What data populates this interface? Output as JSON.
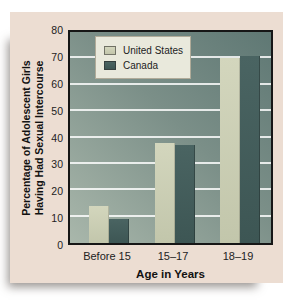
{
  "chart_data": {
    "type": "bar",
    "categories": [
      "Before 15",
      "15–17",
      "18–19"
    ],
    "series": [
      {
        "name": "United States",
        "color_top": "#d3d6bd",
        "color": "#c2c6ab",
        "values": [
          14,
          38,
          70
        ]
      },
      {
        "name": "Canada",
        "color_top": "#4a6462",
        "color": "#3d5654",
        "values": [
          9,
          37,
          71
        ]
      }
    ],
    "xlabel": "Age in Years",
    "ylabel_line1": "Percentage of Adolescent Girls",
    "ylabel_line2": "Having Had Sexual Intercourse",
    "ylim": [
      0,
      80
    ],
    "ytick_step": 10,
    "yticks": [
      0,
      10,
      20,
      30,
      40,
      50,
      60,
      70,
      80
    ],
    "grid": true,
    "gridline_color": "#ffffff",
    "legend_position": "top-inside",
    "plot_bg_dark": "#5f7874",
    "plot_bg_light": "#a9b7ab",
    "panel_bg": "#ecddd2"
  }
}
